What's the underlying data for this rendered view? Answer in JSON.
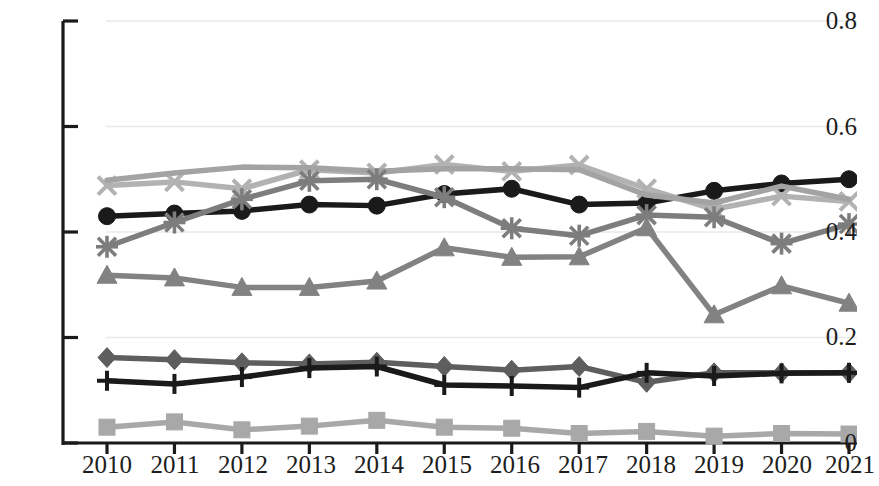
{
  "chart_data": {
    "type": "line",
    "title": "",
    "subtitle": "",
    "xlabel": "",
    "ylabel": "",
    "categories": [
      "2010",
      "2011",
      "2012",
      "2013",
      "2014",
      "2015",
      "2016",
      "2017",
      "2018",
      "2019",
      "2020",
      "2021"
    ],
    "x": [
      2010,
      2011,
      2012,
      2013,
      2014,
      2015,
      2016,
      2017,
      2018,
      2019,
      2020,
      2021
    ],
    "ylim": [
      0,
      0.8
    ],
    "xlim": [
      2010,
      2021
    ],
    "y_ticks": [
      "0",
      "0.2",
      "0.4",
      "0.6",
      "0.8"
    ],
    "y_tick_values": [
      0,
      0.2,
      0.4,
      0.6,
      0.8
    ],
    "x_ticks": [
      "2010",
      "2011",
      "2012",
      "2013",
      "2014",
      "2015",
      "2016",
      "2017",
      "2018",
      "2019",
      "2020",
      "2021"
    ],
    "grid": "horizontal",
    "legend": "none",
    "series": [
      {
        "name": "series-circle-black",
        "marker": "circle",
        "color": "#1a1a1a",
        "values": [
          0.43,
          0.435,
          0.44,
          0.452,
          0.45,
          0.472,
          0.482,
          0.452,
          0.455,
          0.478,
          0.492,
          0.5
        ]
      },
      {
        "name": "series-x-light-gray",
        "marker": "x",
        "color": "#b2b2b2",
        "values": [
          0.488,
          0.495,
          0.482,
          0.518,
          0.512,
          0.528,
          0.515,
          0.527,
          0.482,
          0.443,
          0.468,
          0.458
        ]
      },
      {
        "name": "series-line-gray-upper",
        "marker": "none",
        "color": "#a3a3a3",
        "values": [
          0.498,
          0.512,
          0.523,
          0.522,
          0.515,
          0.52,
          0.52,
          0.518,
          0.47,
          0.455,
          0.487,
          0.462
        ]
      },
      {
        "name": "series-asterisk-dark-gray",
        "marker": "asterisk",
        "color": "#7d7d7d",
        "values": [
          0.372,
          0.418,
          0.462,
          0.497,
          0.5,
          0.466,
          0.407,
          0.393,
          0.432,
          0.428,
          0.378,
          0.415
        ]
      },
      {
        "name": "series-triangle-gray",
        "marker": "triangle",
        "color": "#828282",
        "values": [
          0.318,
          0.313,
          0.295,
          0.295,
          0.307,
          0.37,
          0.352,
          0.353,
          0.408,
          0.243,
          0.298,
          0.265
        ]
      },
      {
        "name": "series-diamond-gray",
        "marker": "diamond",
        "color": "#5e5e5e",
        "values": [
          0.162,
          0.158,
          0.152,
          0.15,
          0.153,
          0.145,
          0.138,
          0.145,
          0.115,
          0.133,
          0.133,
          0.133
        ]
      },
      {
        "name": "series-plus-black",
        "marker": "plus",
        "color": "#1a1a1a",
        "values": [
          0.118,
          0.112,
          0.125,
          0.142,
          0.145,
          0.11,
          0.108,
          0.105,
          0.133,
          0.127,
          0.132,
          0.133
        ]
      },
      {
        "name": "series-square-light-gray",
        "marker": "square",
        "color": "#a8a8a8",
        "values": [
          0.03,
          0.04,
          0.025,
          0.032,
          0.043,
          0.03,
          0.028,
          0.018,
          0.022,
          0.013,
          0.018,
          0.017
        ]
      }
    ]
  },
  "axis": {
    "y_labels": [
      "0.8",
      "0.6",
      "0.4",
      "0.2",
      "0"
    ],
    "x_labels": [
      "2010",
      "2011",
      "2012",
      "2013",
      "2014",
      "2015",
      "2016",
      "2017",
      "2018",
      "2019",
      "2020",
      "2021"
    ]
  },
  "colors": {
    "axis": "#1a1a1a",
    "grid": "#e8e8e8",
    "background": "#ffffff"
  }
}
